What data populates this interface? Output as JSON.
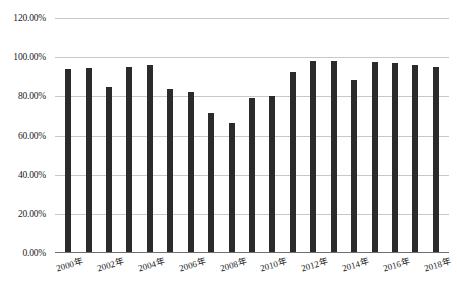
{
  "chart_data": {
    "type": "bar",
    "title": "",
    "subtitle": "",
    "xlabel": "",
    "ylabel": "",
    "categories": [
      "2000年",
      "2001年",
      "2002年",
      "2003年",
      "2004年",
      "2005年",
      "2006年",
      "2007年",
      "2008年",
      "2009年",
      "2010年",
      "2011年",
      "2012年",
      "2013年",
      "2014年",
      "2015年",
      "2016年",
      "2017年",
      "2018年"
    ],
    "values": [
      93.8,
      94.4,
      84.8,
      95.0,
      96.0,
      83.7,
      82.2,
      71.6,
      66.5,
      79.0,
      80.0,
      92.5,
      97.8,
      98.0,
      88.5,
      97.5,
      96.8,
      96.0,
      94.8
    ],
    "value_unit": "%",
    "ylim": [
      0,
      120
    ],
    "y_tick_labels": [
      "0.00%",
      "20.00%",
      "40.00%",
      "60.00%",
      "80.00%",
      "100.00%",
      "120.00%"
    ],
    "y_tick_values": [
      0,
      20,
      40,
      60,
      80,
      100,
      120
    ],
    "x_tick_labels": [
      "2000年",
      "2002年",
      "2004年",
      "2006年",
      "2008年",
      "2010年",
      "2012年",
      "2014年",
      "2016年",
      "2018年"
    ],
    "x_tick_indices": [
      0,
      2,
      4,
      6,
      8,
      10,
      12,
      14,
      16,
      18
    ],
    "grid": true,
    "legend": false,
    "legend_position": "none",
    "bar_color": "#2b2b2b",
    "gridline_color": "#c8c8c8",
    "axis_color": "#6e6e6e",
    "background_color": "#ffffff"
  }
}
